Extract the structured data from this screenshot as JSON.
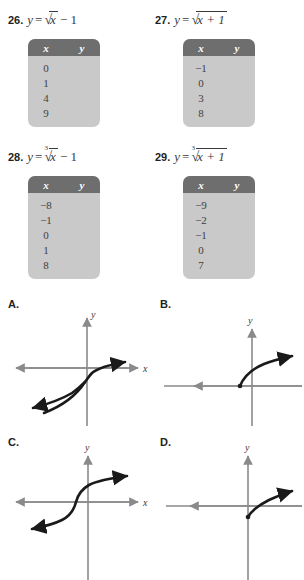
{
  "problems": [
    {
      "number": "26.",
      "lhs": "y",
      "equals": "=",
      "root_index": "",
      "radicand": "x",
      "trailing": "− 1",
      "table": {
        "header_x": "x",
        "header_y": "y",
        "x_values": [
          "0",
          "1",
          "4",
          "9"
        ],
        "y_values": [
          "",
          "",
          "",
          ""
        ]
      }
    },
    {
      "number": "27.",
      "lhs": "y",
      "equals": "=",
      "root_index": "",
      "radicand": "x + 1",
      "trailing": "",
      "table": {
        "header_x": "x",
        "header_y": "y",
        "x_values": [
          "−1",
          "0",
          "3",
          "8"
        ],
        "y_values": [
          "",
          "",
          "",
          ""
        ]
      }
    },
    {
      "number": "28.",
      "lhs": "y",
      "equals": "=",
      "root_index": "3",
      "radicand": "x",
      "trailing": "− 1",
      "table": {
        "header_x": "x",
        "header_y": "y",
        "x_values": [
          "−8",
          "−1",
          "0",
          "1",
          "8"
        ],
        "y_values": [
          "",
          "",
          "",
          "",
          ""
        ]
      }
    },
    {
      "number": "29.",
      "lhs": "y",
      "equals": "=",
      "root_index": "3",
      "radicand": "x + 1",
      "trailing": "",
      "table": {
        "header_x": "x",
        "header_y": "y",
        "x_values": [
          "−9",
          "−2",
          "−1",
          "0",
          "7"
        ],
        "y_values": [
          "",
          "",
          "",
          "",
          ""
        ]
      }
    }
  ],
  "choices": [
    {
      "label": "A.",
      "x_axis_label": "x",
      "y_axis_label": "y",
      "curve": "cube-root-shifted-down"
    },
    {
      "label": "B.",
      "x_axis_label": "x",
      "y_axis_label": "y",
      "curve": "square-root-shifted-left"
    },
    {
      "label": "C.",
      "x_axis_label": "x",
      "y_axis_label": "y",
      "curve": "cube-root-shifted-left"
    },
    {
      "label": "D.",
      "x_axis_label": "x",
      "y_axis_label": "y",
      "curve": "square-root-shifted-down"
    }
  ],
  "colors": {
    "table_header_bg": "#6e6e6e",
    "table_body_bg": "#c9c9c9",
    "text": "#3a3a3c",
    "axis": "#8a8a8a",
    "curve": "#1a1a1a",
    "page_bg": "#ffffff"
  }
}
